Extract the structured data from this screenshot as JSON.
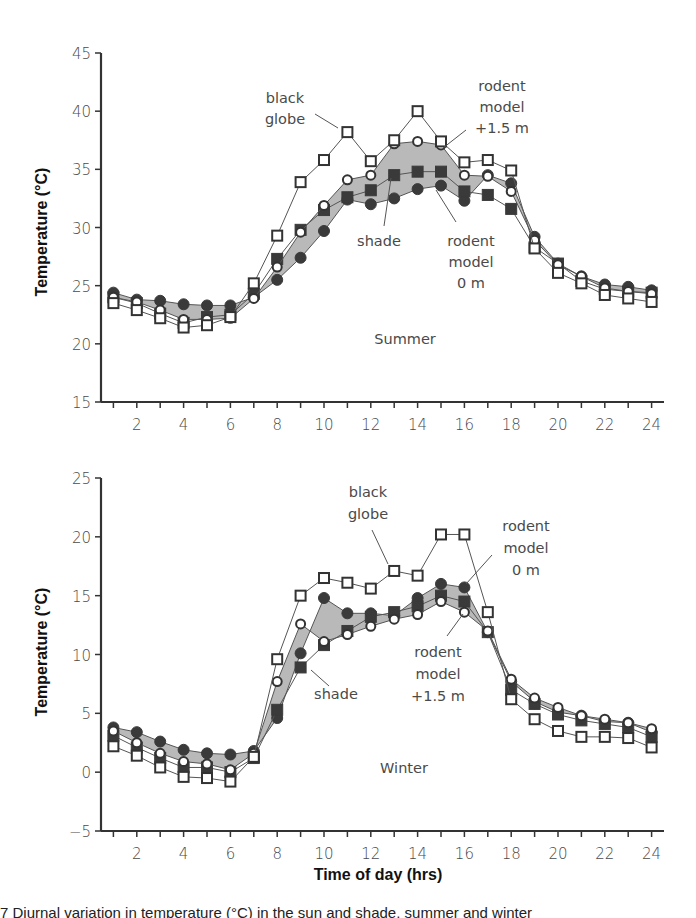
{
  "figure": {
    "caption_fragment": "7 Diurnal variation in temperature (°C) in the sun and shade, summer and winter",
    "xlabel": "Time of day (hrs)"
  },
  "chart_data": [
    {
      "type": "line",
      "title": "Summer",
      "xlabel": "",
      "ylabel": "Temperature (°C)",
      "x": [
        1,
        2,
        3,
        4,
        5,
        6,
        7,
        8,
        9,
        10,
        11,
        12,
        13,
        14,
        15,
        16,
        17,
        18,
        19,
        20,
        21,
        22,
        23,
        24
      ],
      "xticks": [
        2,
        4,
        6,
        8,
        10,
        12,
        14,
        16,
        18,
        20,
        22,
        24
      ],
      "xlim": [
        0,
        24.5
      ],
      "ylim": [
        15,
        45
      ],
      "yticks": [
        15,
        20,
        25,
        30,
        35,
        40,
        45
      ],
      "grid": false,
      "shaded_band": "between rodent model +1.5 m and rodent model 0 m",
      "series": [
        {
          "name": "black globe",
          "marker": "open-square",
          "values": [
            23.5,
            22.9,
            22.2,
            21.4,
            21.6,
            22.3,
            25.2,
            29.3,
            33.9,
            35.8,
            38.2,
            35.7,
            37.5,
            40.0,
            37.4,
            35.6,
            35.8,
            34.9,
            28.2,
            26.1,
            25.2,
            24.2,
            23.9,
            23.6
          ]
        },
        {
          "name": "rodent model +1.5 m",
          "marker": "open-circle",
          "values": [
            24.0,
            23.6,
            22.9,
            22.1,
            22.1,
            22.2,
            23.9,
            26.6,
            29.6,
            31.9,
            34.1,
            34.5,
            37.2,
            37.4,
            37.1,
            34.5,
            34.4,
            33.1,
            28.9,
            26.8,
            25.8,
            24.8,
            24.5,
            24.3
          ]
        },
        {
          "name": "shade",
          "marker": "filled-square",
          "values": [
            24.0,
            23.5,
            22.6,
            21.8,
            22.3,
            22.5,
            24.3,
            27.3,
            29.8,
            31.5,
            32.6,
            33.2,
            34.5,
            34.8,
            34.8,
            33.1,
            32.8,
            31.6,
            28.3,
            26.9,
            25.4,
            24.7,
            24.5,
            24.4
          ]
        },
        {
          "name": "rodent model 0 m",
          "marker": "filled-circle",
          "values": [
            24.4,
            23.8,
            23.7,
            23.4,
            23.3,
            23.3,
            24.0,
            25.5,
            27.4,
            29.7,
            32.4,
            32.0,
            32.5,
            33.3,
            33.6,
            32.3,
            34.5,
            33.8,
            29.2,
            26.9,
            25.8,
            25.1,
            24.9,
            24.6
          ]
        }
      ],
      "annotations": [
        "black globe",
        "rodent model +1.5 m",
        "shade",
        "rodent model 0 m",
        "Summer"
      ]
    },
    {
      "type": "line",
      "title": "Winter",
      "xlabel": "Time of day (hrs)",
      "ylabel": "Temperature (°C)",
      "x": [
        1,
        2,
        3,
        4,
        5,
        6,
        7,
        8,
        9,
        10,
        11,
        12,
        13,
        14,
        15,
        16,
        17,
        18,
        19,
        20,
        21,
        22,
        23,
        24
      ],
      "xticks": [
        2,
        4,
        6,
        8,
        10,
        12,
        14,
        16,
        18,
        20,
        22,
        24
      ],
      "xlim": [
        0,
        24.5
      ],
      "ylim": [
        -5,
        25
      ],
      "yticks": [
        -5,
        0,
        5,
        10,
        15,
        20,
        25
      ],
      "grid": false,
      "shaded_band": "between rodent model 0 m and rodent model +1.5 m",
      "series": [
        {
          "name": "black globe",
          "marker": "open-square",
          "values": [
            2.2,
            1.4,
            0.4,
            -0.4,
            -0.5,
            -0.8,
            1.3,
            9.6,
            15.0,
            16.5,
            16.1,
            15.6,
            17.1,
            16.7,
            20.2,
            20.2,
            13.6,
            6.2,
            4.5,
            3.5,
            3.0,
            3.0,
            2.9,
            2.1
          ]
        },
        {
          "name": "rodent model +1.5 m",
          "marker": "open-circle",
          "values": [
            3.5,
            2.5,
            1.6,
            0.9,
            0.7,
            0.2,
            1.6,
            7.7,
            12.6,
            11.1,
            11.7,
            12.4,
            13.0,
            13.4,
            14.5,
            13.6,
            12.0,
            7.9,
            6.3,
            5.5,
            4.8,
            4.5,
            4.2,
            3.7
          ]
        },
        {
          "name": "shade",
          "marker": "filled-square",
          "values": [
            3.1,
            2.1,
            1.2,
            0.4,
            0.4,
            0.0,
            1.2,
            5.3,
            8.9,
            10.8,
            12.0,
            13.2,
            13.6,
            14.1,
            15.0,
            14.5,
            11.9,
            7.0,
            5.8,
            4.9,
            4.4,
            4.1,
            3.8,
            3.0
          ]
        },
        {
          "name": "rodent model 0 m",
          "marker": "filled-circle",
          "values": [
            3.8,
            3.4,
            2.6,
            1.9,
            1.6,
            1.5,
            1.8,
            4.6,
            10.1,
            14.8,
            13.5,
            13.5,
            13.3,
            14.8,
            16.0,
            15.7,
            11.9,
            7.7,
            6.0,
            5.1,
            4.8,
            4.3,
            4.2,
            3.4
          ]
        }
      ],
      "annotations": [
        "black globe",
        "rodent model 0 m",
        "shade",
        "rodent model +1.5 m",
        "Winter"
      ]
    }
  ],
  "labels": {
    "summer": {
      "season": "Summer",
      "ylabel": "Temperature (°C)",
      "black_globe": [
        "black",
        "globe"
      ],
      "rodent_high": [
        "rodent",
        "model",
        "+1.5 m"
      ],
      "shade": "shade",
      "rodent_low": [
        "rodent",
        "model",
        "0 m"
      ]
    },
    "winter": {
      "season": "Winter",
      "ylabel": "Temperature (°C)",
      "black_globe": [
        "black",
        "globe"
      ],
      "rodent_low": [
        "rodent",
        "model",
        "0 m"
      ],
      "shade": "shade",
      "rodent_high": [
        "rodent",
        "model",
        "+1.5 m"
      ]
    }
  },
  "colors": {
    "axis": "#333333",
    "line": "#555555",
    "band": "#b9b9b9",
    "marker_fill_dark": "#3a3a3a",
    "marker_fill_open": "#ffffff",
    "text": "#4a4a4a"
  }
}
